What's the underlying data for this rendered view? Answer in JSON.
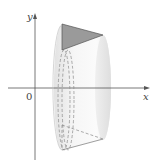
{
  "diagram": {
    "type": "solid-of-revolution",
    "axes": {
      "x_label": "x",
      "y_label": "y",
      "origin_label": "0"
    },
    "colors": {
      "axis": "#555555",
      "solid_light": "#f4f4f4",
      "solid_shade": "#dcdcdc",
      "triangle_fill": "#9a9a9a",
      "triangle_stroke": "#555555",
      "dashed": "#888888"
    }
  }
}
